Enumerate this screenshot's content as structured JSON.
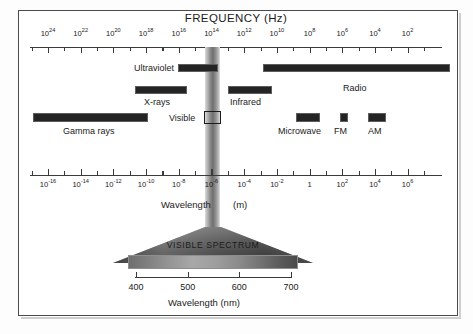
{
  "figure": {
    "title_frequency": "FREQUENCY (Hz)",
    "label_wavelength_m": "Wavelength",
    "label_wavelength_unit": "(m)",
    "label_wavelength_nm": "Wavelength (nm)",
    "visible_spectrum_title": "VISIBLE SPECTRUM"
  },
  "chart_data": {
    "type": "diagram",
    "axes": [
      {
        "name": "frequency",
        "label": "FREQUENCY (Hz)",
        "unit": "Hz",
        "position": "top",
        "direction": "decreasing-right",
        "tick_labels": [
          "10^24",
          "10^22",
          "10^20",
          "10^18",
          "10^16",
          "10^14",
          "10^12",
          "10^10",
          "10^8",
          "10^6",
          "10^4",
          "10^2"
        ],
        "tick_mantissas": [
          "10",
          "10",
          "10",
          "10",
          "10",
          "10",
          "10",
          "10",
          "10",
          "10",
          "10",
          "10"
        ],
        "tick_exponents": [
          "24",
          "22",
          "20",
          "18",
          "16",
          "14",
          "12",
          "10",
          "8",
          "6",
          "4",
          "2"
        ],
        "minor_ticks_between": 1
      },
      {
        "name": "wavelength_m",
        "label": "Wavelength",
        "unit": "(m)",
        "position": "middle",
        "direction": "increasing-right",
        "tick_labels": [
          "10^-16",
          "10^-14",
          "10^-12",
          "10^-10",
          "10^-8",
          "10^-6",
          "10^-4",
          "10^-2",
          "1",
          "10^2",
          "10^4",
          "10^6"
        ],
        "tick_mantissas": [
          "10",
          "10",
          "10",
          "10",
          "10",
          "10",
          "10",
          "10",
          "1",
          "10",
          "10",
          "10"
        ],
        "tick_exponents": [
          "-16",
          "-14",
          "-12",
          "-10",
          "-8",
          "-6",
          "-4",
          "-2",
          "",
          "2",
          "4",
          "6"
        ],
        "minor_ticks_between": 1
      },
      {
        "name": "wavelength_nm",
        "label": "Wavelength (nm)",
        "unit": "nm",
        "position": "bottom",
        "direction": "increasing-right",
        "tick_labels": [
          "400",
          "500",
          "600",
          "700"
        ]
      }
    ],
    "bands": [
      {
        "name": "Gamma rays",
        "label": "Gamma rays",
        "label_position": "below"
      },
      {
        "name": "X-rays",
        "label": "X-rays",
        "label_position": "below"
      },
      {
        "name": "Ultraviolet",
        "label": "Ultraviolet",
        "label_position": "left"
      },
      {
        "name": "Visible",
        "label": "Visible",
        "label_position": "left"
      },
      {
        "name": "Infrared",
        "label": "Infrared",
        "label_position": "below"
      },
      {
        "name": "Radio",
        "label": "Radio",
        "label_position": "below"
      },
      {
        "name": "Microwave",
        "label": "Microwave",
        "label_position": "below"
      },
      {
        "name": "FM",
        "label": "FM",
        "label_position": "below"
      },
      {
        "name": "AM",
        "label": "AM",
        "label_position": "below"
      }
    ],
    "visible_spectrum": {
      "title": "VISIBLE SPECTRUM",
      "range_nm": [
        400,
        700
      ],
      "tick_labels": [
        "400",
        "500",
        "600",
        "700"
      ],
      "axis_label": "Wavelength (nm)"
    }
  },
  "freq_ticks": [
    {
      "m": "10",
      "e": "24"
    },
    {
      "m": "10",
      "e": "22"
    },
    {
      "m": "10",
      "e": "20"
    },
    {
      "m": "10",
      "e": "18"
    },
    {
      "m": "10",
      "e": "16"
    },
    {
      "m": "10",
      "e": "14"
    },
    {
      "m": "10",
      "e": "12"
    },
    {
      "m": "10",
      "e": "10"
    },
    {
      "m": "10",
      "e": "8"
    },
    {
      "m": "10",
      "e": "6"
    },
    {
      "m": "10",
      "e": "4"
    },
    {
      "m": "10",
      "e": "2"
    }
  ],
  "wave_ticks": [
    {
      "m": "10",
      "e": "-16"
    },
    {
      "m": "10",
      "e": "-14"
    },
    {
      "m": "10",
      "e": "-12"
    },
    {
      "m": "10",
      "e": "-10"
    },
    {
      "m": "10",
      "e": "-8"
    },
    {
      "m": "10",
      "e": "-6"
    },
    {
      "m": "10",
      "e": "-4"
    },
    {
      "m": "10",
      "e": "-2"
    },
    {
      "m": "1",
      "e": ""
    },
    {
      "m": "10",
      "e": "2"
    },
    {
      "m": "10",
      "e": "4"
    },
    {
      "m": "10",
      "e": "6"
    }
  ],
  "nm_ticks": [
    "400",
    "500",
    "600",
    "700"
  ],
  "bands": {
    "gamma": {
      "label": "Gamma rays"
    },
    "xrays": {
      "label": "X-rays"
    },
    "ultraviolet": {
      "label": "Ultraviolet"
    },
    "visible": {
      "label": "Visible"
    },
    "infrared": {
      "label": "Infrared"
    },
    "radio": {
      "label": "Radio"
    },
    "microwave": {
      "label": "Microwave"
    },
    "fm": {
      "label": "FM"
    },
    "am": {
      "label": "AM"
    }
  },
  "colors": {
    "bar": "#242424",
    "frame": "#4b4b4b",
    "text": "#1b1b1b",
    "axis": "#3a3a3a"
  }
}
